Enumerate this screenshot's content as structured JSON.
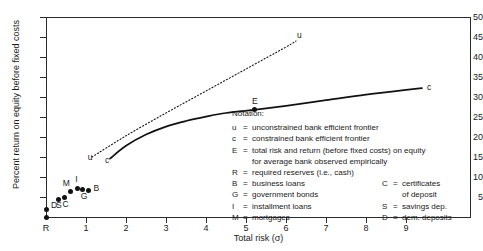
{
  "chart_data": {
    "type": "scatter",
    "title": "",
    "xlabel": "Total risk (σ)",
    "ylabel": "Percent return on equity before fixed costs",
    "xlim": [
      0,
      10.6
    ],
    "ylim": [
      0,
      50
    ],
    "xticks": [
      "1",
      "2",
      "3",
      "4",
      "5",
      "6",
      "7",
      "8",
      "9"
    ],
    "xtick_values": [
      1,
      2,
      3,
      4,
      5,
      6,
      7,
      8,
      9
    ],
    "origin_label": "R",
    "yticks": [
      "5",
      "10",
      "15",
      "20",
      "25",
      "30",
      "35",
      "40",
      "45",
      "50"
    ],
    "ytick_values": [
      5,
      10,
      15,
      20,
      25,
      30,
      35,
      40,
      45,
      50
    ],
    "grid": false,
    "legend": "inline-annotations",
    "series": [
      {
        "name": "u",
        "label": "u",
        "style": "dotted",
        "description": "unconstrained bank efficient frontier",
        "points": [
          [
            1.15,
            15.0
          ],
          [
            2.0,
            20.3
          ],
          [
            3.0,
            26.0
          ],
          [
            4.0,
            31.5
          ],
          [
            5.0,
            37.0
          ],
          [
            6.0,
            42.5
          ],
          [
            6.25,
            44.0
          ]
        ],
        "start_label_x": 1.12,
        "start_label_y": 15.0,
        "end_label_x": 6.35,
        "end_label_y": 45.6
      },
      {
        "name": "c",
        "label": "c",
        "style": "solid",
        "description": "constrained bank efficient frontier",
        "points": [
          [
            1.6,
            14.6
          ],
          [
            2.0,
            17.8
          ],
          [
            2.5,
            20.6
          ],
          [
            3.0,
            22.6
          ],
          [
            3.5,
            24.0
          ],
          [
            4.0,
            25.1
          ],
          [
            4.5,
            26.0
          ],
          [
            5.2,
            26.8
          ],
          [
            6.0,
            27.8
          ],
          [
            7.0,
            29.2
          ],
          [
            8.0,
            30.6
          ],
          [
            9.0,
            31.8
          ],
          [
            9.4,
            32.2
          ]
        ],
        "start_label_x": 1.55,
        "start_label_y": 14.2,
        "end_label_x": 9.6,
        "end_label_y": 32.6
      }
    ],
    "points": [
      {
        "code": "R",
        "x": 0.0,
        "y": 0.0,
        "label_dx": -1,
        "label_dy": 9,
        "show_dot": true,
        "label_hidden": true
      },
      {
        "code": "D",
        "x": 0.0,
        "y": 2.0,
        "label_dx": 5,
        "label_dy": -4,
        "show_dot": true
      },
      {
        "code": "S",
        "x": 0.3,
        "y": 4.3,
        "label_dx": -2,
        "label_dy": 5,
        "show_dot": true
      },
      {
        "code": "C",
        "x": 0.46,
        "y": 4.8,
        "label_dx": -2,
        "label_dy": 6,
        "show_dot": true
      },
      {
        "code": "M",
        "x": 0.62,
        "y": 6.4,
        "label_dx": -8,
        "label_dy": -8,
        "show_dot": true
      },
      {
        "code": "I",
        "x": 0.78,
        "y": 7.2,
        "label_dx": -2,
        "label_dy": -9,
        "show_dot": true
      },
      {
        "code": "G",
        "x": 0.92,
        "y": 6.9,
        "label_dx": -2,
        "label_dy": 7,
        "show_dot": true
      },
      {
        "code": "B",
        "x": 1.06,
        "y": 6.6,
        "label_dx": 5,
        "label_dy": -3,
        "show_dot": true
      }
    ],
    "marked_points": [
      {
        "code": "E",
        "x": 5.2,
        "y": 26.8,
        "label_dx": -2,
        "label_dy": -9
      }
    ]
  },
  "notation": {
    "title": "Notation:",
    "left_entries": [
      {
        "key": "u",
        "eq": "=",
        "text": "unconstrained bank efficient frontier"
      },
      {
        "key": "c",
        "eq": "=",
        "text": "constrained bank efficient frontier"
      },
      {
        "key": "E",
        "eq": "=",
        "text": "total risk and return (before fixed costs) on equity"
      },
      {
        "key": "",
        "eq": "",
        "text": "for average bank observed empirically",
        "continuation": true
      },
      {
        "key": "R",
        "eq": "=",
        "text": "required reserves (i.e., cash)"
      },
      {
        "key": "B",
        "eq": "=",
        "text": "business loans"
      },
      {
        "key": "G",
        "eq": "=",
        "text": "government bonds"
      },
      {
        "key": "I",
        "eq": "=",
        "text": "installment loans"
      },
      {
        "key": "M",
        "eq": "=",
        "text": "mortgages"
      }
    ],
    "right_entries": [
      {
        "row": 5,
        "key": "C",
        "eq": "=",
        "text": "certificates"
      },
      {
        "row": 6,
        "key": "",
        "eq": "",
        "text": "of deposit",
        "continuation": true
      },
      {
        "row": 7,
        "key": "S",
        "eq": "=",
        "text": "savings dep."
      },
      {
        "row": 8,
        "key": "D",
        "eq": "=",
        "text": "dem. deposits"
      }
    ]
  },
  "colors": {
    "axis": "#2b2b2b",
    "curve": "#111111",
    "marker": "#111111",
    "text": "#1a1a1a",
    "background": "#ffffff"
  }
}
